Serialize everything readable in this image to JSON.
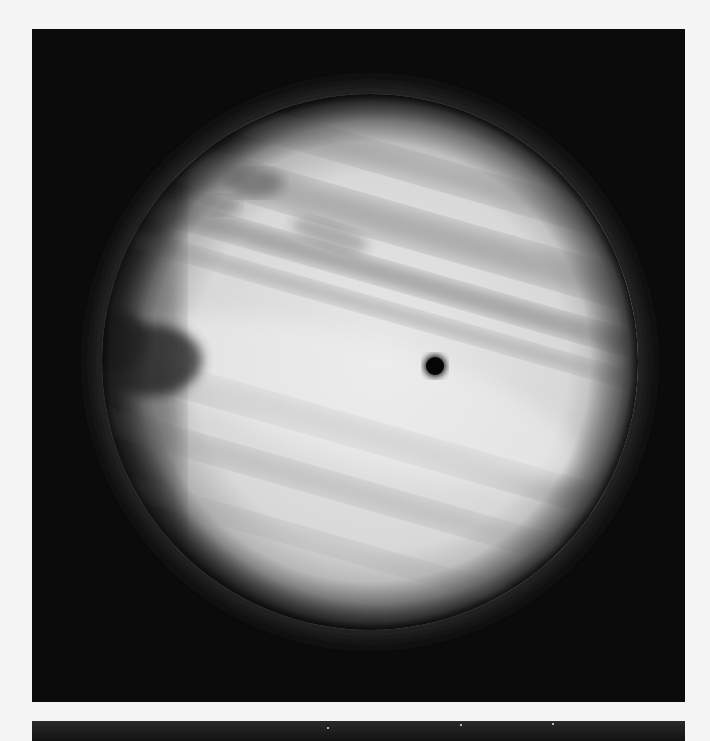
{
  "image": {
    "subject": "Jupiter",
    "description": "Grayscale photograph of Jupiter showing cloud bands, the Great Red Spot on the left limb, and a moon shadow on the disc",
    "colors": {
      "page_background": "#f4f4f4",
      "space_background": "#0b0b0b",
      "planet_light": "#e6e6e6",
      "planet_band": "#9a9a9a",
      "great_red_spot": "#3a3a3a",
      "moon_shadow": "#050505"
    },
    "features": {
      "planet_center": [
        370,
        360
      ],
      "planet_radius": 268,
      "great_red_spot_center": [
        150,
        360
      ],
      "moon_shadow_center": [
        435,
        366
      ],
      "moon_shadow_radius": 11
    }
  }
}
